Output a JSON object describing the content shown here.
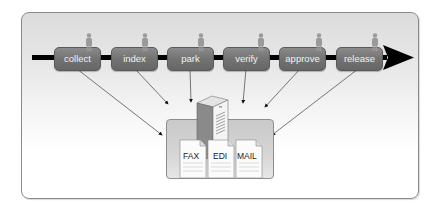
{
  "diagram": {
    "title": "",
    "process_steps": [
      {
        "label": "collect",
        "x": 54
      },
      {
        "label": "index",
        "x": 111
      },
      {
        "label": "park",
        "x": 167
      },
      {
        "label": "verify",
        "x": 223
      },
      {
        "label": "approve",
        "x": 279
      },
      {
        "label": "release",
        "x": 336
      }
    ],
    "repository": {
      "server": "server-icon",
      "documents": [
        "FAX",
        "EDI",
        "MAIL"
      ]
    },
    "colors": {
      "step_fill": "#767676",
      "step_text": "#f2f2f2",
      "timeline": "#000000",
      "container": "#d0d0d0",
      "person": "#9a9a9a"
    }
  }
}
